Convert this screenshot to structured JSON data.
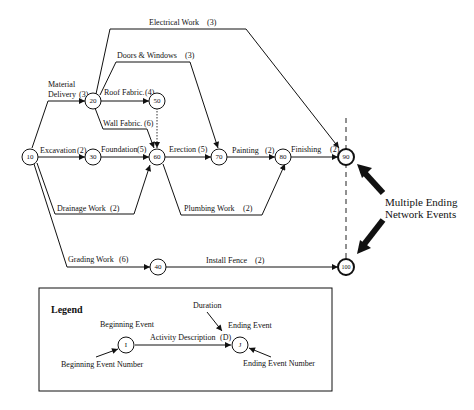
{
  "diagram": {
    "nodes": [
      {
        "id": "10",
        "label": "10"
      },
      {
        "id": "20",
        "label": "20"
      },
      {
        "id": "30",
        "label": "30"
      },
      {
        "id": "40",
        "label": "40"
      },
      {
        "id": "50",
        "label": "50"
      },
      {
        "id": "60",
        "label": "60"
      },
      {
        "id": "70",
        "label": "70"
      },
      {
        "id": "80",
        "label": "80"
      },
      {
        "id": "90",
        "label": "90",
        "ending": true
      },
      {
        "id": "100",
        "label": "100",
        "ending": true
      }
    ],
    "activities": [
      {
        "from": "10",
        "to": "20",
        "name": "Material Delivery",
        "name_line1": "Material",
        "name_line2": "Delivery",
        "duration": "(3)"
      },
      {
        "from": "20",
        "to": "90",
        "name": "Electrical Work",
        "duration": "(3)"
      },
      {
        "from": "20",
        "to": "70",
        "name": "Doors & Windows",
        "duration": "(3)"
      },
      {
        "from": "20",
        "to": "50",
        "name": "Roof Fabric.",
        "duration": "(4)"
      },
      {
        "from": "20",
        "to": "60",
        "name": "Wall Fabric.",
        "duration": "(6)"
      },
      {
        "from": "50",
        "to": "60",
        "name": "",
        "duration": "",
        "dummy": true
      },
      {
        "from": "10",
        "to": "30",
        "name": "Excavation",
        "duration": "(2)"
      },
      {
        "from": "30",
        "to": "60",
        "name": "Foundation",
        "duration": "(5)"
      },
      {
        "from": "10",
        "to": "60",
        "name": "Drainage Work",
        "duration": "(2)"
      },
      {
        "from": "60",
        "to": "70",
        "name": "Erection",
        "duration": "(5)"
      },
      {
        "from": "70",
        "to": "80",
        "name": "Painting",
        "duration": "(2)"
      },
      {
        "from": "60",
        "to": "80",
        "name": "Plumbing Work",
        "duration": "(2)"
      },
      {
        "from": "80",
        "to": "90",
        "name": "Finishing",
        "duration": "(2)"
      },
      {
        "from": "10",
        "to": "40",
        "name": "Grading Work",
        "duration": "(6)"
      },
      {
        "from": "40",
        "to": "100",
        "name": "Install Fence",
        "duration": "(2)"
      }
    ],
    "annotation": {
      "line1": "Multiple Ending",
      "line2": "Network Events"
    }
  },
  "legend": {
    "title": "Legend",
    "beginning_event": "Beginning Event",
    "beginning_event_number": "Beginning Event Number",
    "ending_event": "Ending Event",
    "ending_event_number": "Ending Event Number",
    "duration_label": "Duration",
    "activity_description": "Activity Description",
    "duration_symbol": "(D)",
    "node_i": "I",
    "node_j": "J"
  }
}
